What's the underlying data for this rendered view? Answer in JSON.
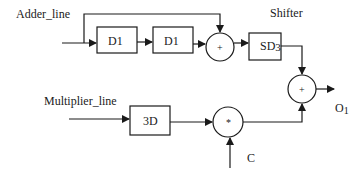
{
  "diagram": {
    "inputs": {
      "adder_line": "Adder_line",
      "multiplier_line": "Multiplier_line",
      "constant": "C"
    },
    "blocks": {
      "delay1": "D1",
      "delay2": "D1",
      "shifter_label": "Shifter",
      "shifter_main": "SD",
      "shifter_sub": "3",
      "delay3": "3D"
    },
    "operators": {
      "adder1": "+",
      "adder2": "+",
      "multiplier": "*"
    },
    "outputs": {
      "output_main": "O",
      "output_sub": "1"
    },
    "colors": {
      "stroke": "#1a1a1a",
      "background": "#ffffff"
    }
  }
}
